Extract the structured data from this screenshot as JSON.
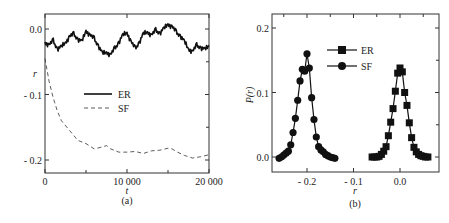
{
  "chart_data": [
    {
      "type": "line",
      "panel_label": "(a)",
      "title": "",
      "xlabel": "t",
      "ylabel": "r",
      "xlim": [
        0,
        20000
      ],
      "ylim": [
        -0.22,
        0.02
      ],
      "xticks": [
        0,
        10000,
        20000
      ],
      "xtick_labels": [
        "0",
        "10 000",
        "20 000"
      ],
      "yticks": [
        0.0,
        -0.1,
        -0.2
      ],
      "ytick_labels": [
        "0.0",
        "- 0.1",
        "- 0.2"
      ],
      "legend": {
        "placement": "center-left",
        "entries": [
          "ER",
          "SF"
        ]
      },
      "grid": false,
      "series": [
        {
          "name": "ER",
          "style": "solid",
          "x": [
            0,
            500,
            1000,
            1500,
            2000,
            2500,
            3000,
            3500,
            4000,
            4500,
            5000,
            5500,
            6000,
            6500,
            7000,
            7500,
            8000,
            8500,
            9000,
            9500,
            10000,
            10500,
            11000,
            11500,
            12000,
            12500,
            13000,
            13500,
            14000,
            14500,
            15000,
            15500,
            16000,
            16500,
            17000,
            17500,
            18000,
            18500,
            19000,
            19500,
            20000
          ],
          "values": [
            -0.02,
            -0.025,
            -0.018,
            -0.03,
            -0.028,
            -0.02,
            -0.012,
            -0.008,
            -0.015,
            -0.02,
            -0.002,
            -0.01,
            -0.015,
            -0.025,
            -0.038,
            -0.035,
            -0.04,
            -0.03,
            -0.02,
            -0.01,
            -0.005,
            -0.02,
            -0.03,
            -0.02,
            -0.008,
            -0.004,
            -0.01,
            -0.002,
            -0.006,
            0.0,
            0.008,
            0.003,
            -0.005,
            -0.01,
            -0.02,
            -0.03,
            -0.035,
            -0.025,
            -0.028,
            -0.032,
            -0.025
          ]
        },
        {
          "name": "SF",
          "style": "dashed",
          "x": [
            0,
            500,
            1000,
            1500,
            2000,
            3000,
            4000,
            5000,
            6000,
            7000,
            7500,
            8000,
            9000,
            10000,
            11000,
            12000,
            13000,
            14000,
            15000,
            15500,
            16000,
            17000,
            18000,
            19000,
            20000
          ],
          "values": [
            -0.045,
            -0.08,
            -0.105,
            -0.125,
            -0.14,
            -0.155,
            -0.17,
            -0.175,
            -0.183,
            -0.18,
            -0.178,
            -0.183,
            -0.188,
            -0.188,
            -0.187,
            -0.19,
            -0.186,
            -0.185,
            -0.182,
            -0.183,
            -0.187,
            -0.193,
            -0.197,
            -0.195,
            -0.192
          ]
        }
      ]
    },
    {
      "type": "line",
      "panel_label": "(b)",
      "title": "",
      "xlabel": "r",
      "ylabel": "P(r)",
      "xlim": [
        -0.27,
        0.09
      ],
      "ylim": [
        -0.02,
        0.22
      ],
      "xticks": [
        -0.2,
        -0.1,
        0.0
      ],
      "xtick_labels": [
        "- 0.2",
        "- 0.1",
        "0.0"
      ],
      "yticks": [
        0.0,
        0.1,
        0.2
      ],
      "ytick_labels": [
        "0.0",
        "0.1",
        "0.2"
      ],
      "legend": {
        "placement": "top-center",
        "entries": [
          "ER",
          "SF"
        ]
      },
      "grid": false,
      "series": [
        {
          "name": "ER",
          "marker": "square",
          "x": [
            -0.06,
            -0.055,
            -0.05,
            -0.045,
            -0.04,
            -0.035,
            -0.03,
            -0.025,
            -0.02,
            -0.015,
            -0.01,
            -0.005,
            0.0,
            0.005,
            0.01,
            0.015,
            0.02,
            0.025,
            0.03,
            0.035,
            0.04,
            0.045,
            0.05,
            0.055,
            0.06
          ],
          "values": [
            0.0,
            0.0,
            0.0,
            0.001,
            0.004,
            0.009,
            0.016,
            0.033,
            0.054,
            0.075,
            0.102,
            0.13,
            0.138,
            0.132,
            0.1,
            0.08,
            0.053,
            0.03,
            0.015,
            0.008,
            0.004,
            0.002,
            0.001,
            0.0,
            0.0
          ]
        },
        {
          "name": "SF",
          "marker": "circle",
          "x": [
            -0.26,
            -0.255,
            -0.25,
            -0.245,
            -0.24,
            -0.235,
            -0.23,
            -0.225,
            -0.22,
            -0.215,
            -0.21,
            -0.205,
            -0.2,
            -0.195,
            -0.19,
            -0.185,
            -0.18,
            -0.175,
            -0.17,
            -0.165,
            -0.16,
            -0.155,
            -0.15,
            -0.145,
            -0.14
          ],
          "values": [
            -0.002,
            0.0,
            0.003,
            0.006,
            0.009,
            0.019,
            0.038,
            0.06,
            0.088,
            0.118,
            0.136,
            0.133,
            0.16,
            0.138,
            0.092,
            0.058,
            0.031,
            0.016,
            0.011,
            0.008,
            0.004,
            0.002,
            0.0,
            -0.001,
            -0.002
          ]
        }
      ]
    }
  ]
}
